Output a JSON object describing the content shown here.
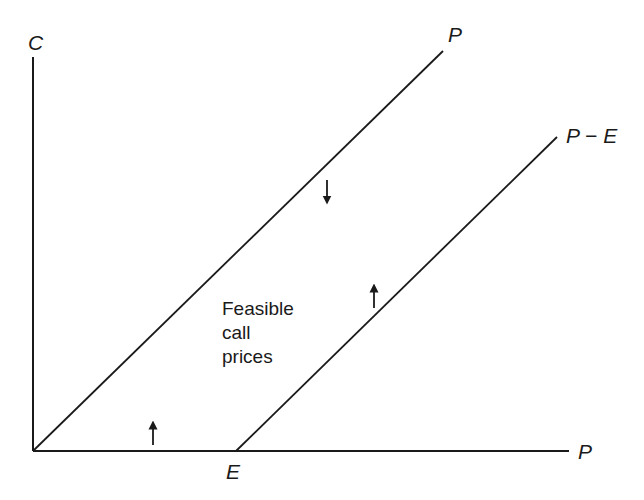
{
  "axes": {
    "y_label": "C",
    "x_label": "P"
  },
  "lines": [
    {
      "id": "upper-bound",
      "label": "P",
      "description": "C = P (upper bound)"
    },
    {
      "id": "lower-bound",
      "label": "P − E",
      "description": "C = P − E (lower bound)"
    }
  ],
  "x_marker": {
    "label": "E"
  },
  "region": {
    "line1": "Feasible",
    "line2": "call",
    "line3": "prices"
  },
  "arrows": [
    {
      "direction": "down",
      "meaning": "below upper bound"
    },
    {
      "direction": "up",
      "meaning": "above lower bound P - E"
    },
    {
      "direction": "up",
      "meaning": "above zero axis"
    }
  ],
  "colors": {
    "ink": "#1a1a1a",
    "background": "#ffffff"
  }
}
